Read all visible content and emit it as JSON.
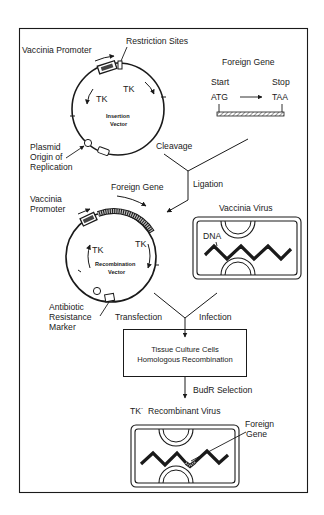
{
  "figure": {
    "colors": {
      "ink": "#1a1a1a",
      "background": "#ffffff",
      "hatch_fill": "#9a9a9a"
    }
  },
  "insertion_vector": {
    "promoter_label": "Vaccinia Promoter",
    "restriction_label": "Restriction Sites",
    "tk_left": "TK",
    "tk_right": "TK",
    "center_line1": "Insertion",
    "center_line2": "Vector",
    "origin_line1": "Plasmid",
    "origin_line2": "Origin of",
    "origin_line3": "Replication"
  },
  "foreign_gene": {
    "title": "Foreign Gene",
    "start_label": "Start",
    "stop_label": "Stop",
    "start_codon": "ATG",
    "stop_codon": "TAA"
  },
  "steps": {
    "cleavage": "Cleavage",
    "ligation": "Ligation",
    "transfection": "Transfection",
    "infection": "Infection",
    "budr_selection": "BudR Selection"
  },
  "recombination_vector": {
    "foreign_gene_label": "Foreign Gene",
    "promoter_line1": "Vaccinia",
    "promoter_line2": "Promoter",
    "tk_left": "TK",
    "tk_right": "TK",
    "center_line1": "Recombination",
    "center_line2": "Vector",
    "marker_line1": "Antibiotic",
    "marker_line2": "Resistance",
    "marker_line3": "Marker"
  },
  "vaccinia_virus": {
    "title": "Vaccinia Virus",
    "dna_label": "DNA"
  },
  "culture_box": {
    "line1": "Tissue Culture Cells",
    "line2": "Homologous Recombination"
  },
  "recombinant_virus": {
    "title_prefix": "TK",
    "title_sup": "-",
    "title_suffix": "Recombinant Virus",
    "foreign_line1": "Foreign",
    "foreign_line2": "Gene"
  }
}
